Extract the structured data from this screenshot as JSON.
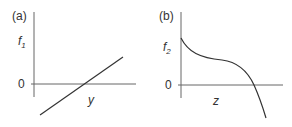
{
  "figure": {
    "panels": [
      {
        "id": "a",
        "tag": "(a)",
        "y_label": "f",
        "y_label_sub": "1",
        "x_label": "y",
        "zero_label": "0",
        "curve": "straight line with positive slope crossing zero"
      },
      {
        "id": "b",
        "tag": "(b)",
        "y_label": "f",
        "y_label_sub": "2",
        "x_label": "z",
        "zero_label": "0",
        "curve": "decreasing cubic-like curve starting at f2 intercept, flattening, then dropping below zero"
      }
    ],
    "colors": {
      "axis": "#555555",
      "curve": "#333333",
      "text": "#333333"
    }
  }
}
